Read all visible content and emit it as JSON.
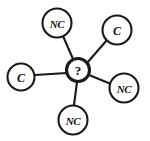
{
  "diagram": {
    "background_color": "#ffffff",
    "stroke_color": "#1a1a1a",
    "label_color": "#111111",
    "canvas": {
      "width": 150,
      "height": 141
    },
    "hub": {
      "id": "hub",
      "label": "?",
      "cx": 78,
      "cy": 70,
      "r": 11.5,
      "stroke_width": 3.1
    },
    "nodes": [
      {
        "id": "node-nc-top-left",
        "label": "NC",
        "cx": 57,
        "cy": 23,
        "r": 14.5
      },
      {
        "id": "node-c-top-right",
        "label": "C",
        "cx": 117,
        "cy": 30,
        "r": 14.5
      },
      {
        "id": "node-c-left",
        "label": "C",
        "cx": 21,
        "cy": 77,
        "r": 13.5
      },
      {
        "id": "node-nc-bottom-right",
        "label": "NC",
        "cx": 124,
        "cy": 88,
        "r": 14.5
      },
      {
        "id": "node-nc-bottom",
        "label": "NC",
        "cx": 73,
        "cy": 120,
        "r": 14.5
      }
    ],
    "edges": [
      {
        "id": "edge-hub-nc-top-left",
        "from": "hub",
        "to": "node-nc-top-left",
        "x1": 73,
        "y1": 59,
        "x2": 63,
        "y2": 36
      },
      {
        "id": "edge-hub-c-top-right",
        "from": "hub",
        "to": "node-c-top-right",
        "x1": 87,
        "y1": 63,
        "x2": 107,
        "y2": 40
      },
      {
        "id": "edge-hub-c-left",
        "from": "hub",
        "to": "node-c-left",
        "x1": 67,
        "y1": 73,
        "x2": 35,
        "y2": 75
      },
      {
        "id": "edge-hub-nc-bottom-right",
        "from": "hub",
        "to": "node-nc-bottom-right",
        "x1": 89,
        "y1": 75,
        "x2": 111,
        "y2": 84
      },
      {
        "id": "edge-hub-nc-bottom",
        "from": "hub",
        "to": "node-nc-bottom",
        "x1": 77,
        "y1": 82,
        "x2": 74,
        "y2": 105
      }
    ]
  }
}
